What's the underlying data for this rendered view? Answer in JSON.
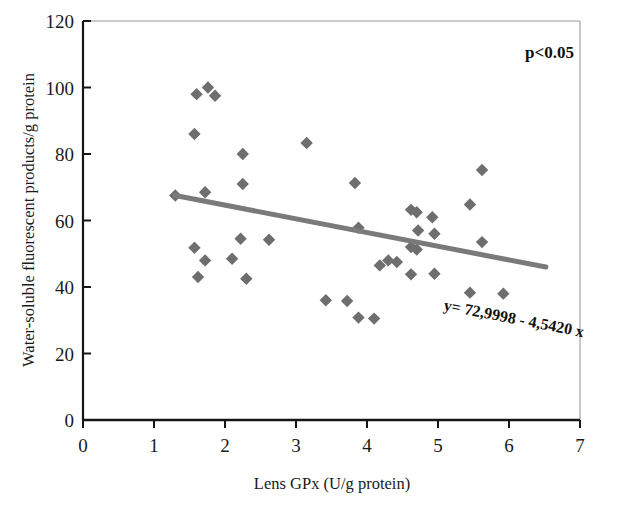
{
  "chart_data": {
    "type": "scatter",
    "title": "",
    "xlabel": "Lens GPx (U/g protein)",
    "ylabel": "Water-soluble fluorescent products/g protein",
    "xlim": [
      0,
      7
    ],
    "ylim": [
      0,
      120
    ],
    "xticks": [
      0,
      1,
      2,
      3,
      4,
      5,
      6,
      7
    ],
    "yticks": [
      0,
      20,
      40,
      60,
      80,
      100,
      120
    ],
    "xtick_labels": [
      "0",
      "1",
      "2",
      "3",
      "4",
      "5",
      "6",
      "7"
    ],
    "ytick_labels": [
      "0",
      "20",
      "40",
      "60",
      "80",
      "100",
      "120"
    ],
    "grid": false,
    "legend": null,
    "marker_shape": "diamond",
    "marker_color": "#6e6e6e",
    "series": [
      {
        "name": "Lens samples",
        "points": [
          [
            1.6,
            98.0
          ],
          [
            1.76,
            100.0
          ],
          [
            1.86,
            97.5
          ],
          [
            1.57,
            86.0
          ],
          [
            2.25,
            80.0
          ],
          [
            3.15,
            83.3
          ],
          [
            2.25,
            71.0
          ],
          [
            3.83,
            71.3
          ],
          [
            5.62,
            75.2
          ],
          [
            1.3,
            67.5
          ],
          [
            1.72,
            68.5
          ],
          [
            5.45,
            64.8
          ],
          [
            2.22,
            54.5
          ],
          [
            2.62,
            54.2
          ],
          [
            3.88,
            57.8
          ],
          [
            4.62,
            63.2
          ],
          [
            4.7,
            62.5
          ],
          [
            4.92,
            61.0
          ],
          [
            5.62,
            53.5
          ],
          [
            1.57,
            51.8
          ],
          [
            4.72,
            57.0
          ],
          [
            4.95,
            56.0
          ],
          [
            1.72,
            48.0
          ],
          [
            2.1,
            48.5
          ],
          [
            4.3,
            48.0
          ],
          [
            4.42,
            47.5
          ],
          [
            4.62,
            52.0
          ],
          [
            4.7,
            51.3
          ],
          [
            1.62,
            43.0
          ],
          [
            2.3,
            42.5
          ],
          [
            4.18,
            46.5
          ],
          [
            4.62,
            43.8
          ],
          [
            4.95,
            44.0
          ],
          [
            3.42,
            36.0
          ],
          [
            3.72,
            35.8
          ],
          [
            5.45,
            38.3
          ],
          [
            5.92,
            38.0
          ],
          [
            3.88,
            30.8
          ],
          [
            4.1,
            30.5
          ]
        ]
      }
    ],
    "trendline": {
      "equation_label": "y= 72,9998 - 4,5420 x",
      "intercept": 72.9998,
      "slope": -4.542,
      "color": "#7a7a7a",
      "x_start": 1.3,
      "x_end": 6.52,
      "y_start": 67.5,
      "y_end": 46.0
    },
    "annotations": [
      {
        "name": "significance",
        "text": "p<0.05",
        "x": 6.35,
        "y": 112
      },
      {
        "name": "regression-equation",
        "text": "y= 72,9998 - 4,5420 x",
        "x": 4.72,
        "y": 35,
        "rotation": 11
      }
    ]
  },
  "axes": {
    "x_title": "Lens GPx (U/g protein)",
    "y_title": "Water-soluble fluorescent products/g protein"
  }
}
